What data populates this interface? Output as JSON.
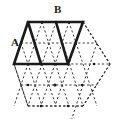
{
  "figure": {
    "type": "geometric-diagram",
    "width": 117,
    "height": 119,
    "background_color": "#ffffff",
    "labels": [
      {
        "id": "A",
        "text": "A",
        "x": 13,
        "y": 42,
        "anchor_vertex": [
          28,
          22
        ]
      },
      {
        "id": "B",
        "text": "B",
        "x": 57,
        "y": 9,
        "anchor_vertex": [
          56,
          22
        ]
      }
    ],
    "styles": {
      "solid_stroke_color": "#1a1a1a",
      "solid_stroke_width": 2.6,
      "dashed_stroke_color": "#3a3a3a",
      "dashed_stroke_width": 1.0,
      "dash_pattern": "2.2 2.2",
      "dot_color": "#1a1a1a",
      "dot_radius": 1.3
    },
    "lattice": {
      "description": "hexagonal region filled with equilateral triangular grid",
      "spacing_x": 13.8,
      "spacing_y": 21,
      "center": [
        60,
        64
      ],
      "rows": [
        {
          "y": 22,
          "x_start": 28,
          "x_end": 83,
          "count": 5
        },
        {
          "y": 43,
          "x_start": 21,
          "x_end": 90,
          "count": 6
        },
        {
          "y": 64,
          "x_start": 14,
          "x_end": 97,
          "count": 7
        },
        {
          "y": 85,
          "x_start": 21,
          "x_end": 90,
          "count": 6
        },
        {
          "y": 106,
          "x_start": 28,
          "x_end": 83,
          "count": 5
        }
      ],
      "hexagon_outline": [
        [
          28,
          22
        ],
        [
          83,
          22
        ],
        [
          110,
          64
        ],
        [
          83,
          106
        ],
        [
          28,
          106
        ],
        [
          14,
          64
        ]
      ]
    },
    "solid_shape": {
      "description": "bold trapezoid composed of three unit triangles with an interior bold edge",
      "outline": [
        [
          14,
          64
        ],
        [
          28,
          22
        ],
        [
          83,
          22
        ],
        [
          68,
          64
        ]
      ],
      "interior_edges": [
        {
          "from": [
            56,
            22
          ],
          "to": [
            68,
            64
          ]
        },
        {
          "from": [
            41,
            64
          ],
          "to": [
            28,
            22
          ]
        }
      ]
    },
    "lattice_dots": [
      [
        41,
        64
      ],
      [
        68,
        64
      ],
      [
        94,
        64
      ],
      [
        28,
        85
      ],
      [
        55,
        85
      ],
      [
        82,
        85
      ],
      [
        41,
        106
      ],
      [
        68,
        106
      ],
      [
        83,
        22
      ]
    ]
  }
}
